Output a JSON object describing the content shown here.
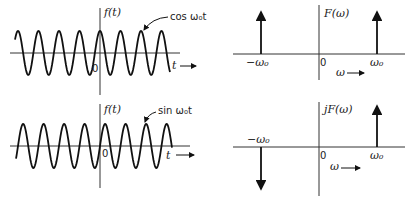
{
  "panels": {
    "cos_time": {
      "y_label": "f(t)",
      "x_label": "t",
      "origin_label": "0",
      "curve_label": "cos ω₀t",
      "function": "cos"
    },
    "cos_freq": {
      "y_label": "F(ω)",
      "x_label": "ω",
      "origin_label": "0",
      "tick_left": "−ω₀",
      "tick_right": "ω₀",
      "impulses": [
        {
          "at": "-w0",
          "direction": "up"
        },
        {
          "at": "w0",
          "direction": "up"
        }
      ]
    },
    "sin_time": {
      "y_label": "f(t)",
      "x_label": "t",
      "origin_label": "0",
      "curve_label": "sin ω₀t",
      "function": "sin"
    },
    "sin_freq": {
      "y_label": "jF(ω)",
      "x_label": "ω",
      "origin_label": "0",
      "tick_left": "−ω₀",
      "tick_right": "ω₀",
      "impulses": [
        {
          "at": "-w0",
          "direction": "down"
        },
        {
          "at": "w0",
          "direction": "up"
        }
      ]
    }
  },
  "style": {
    "ink": "#111111",
    "background": "#ffffff"
  }
}
